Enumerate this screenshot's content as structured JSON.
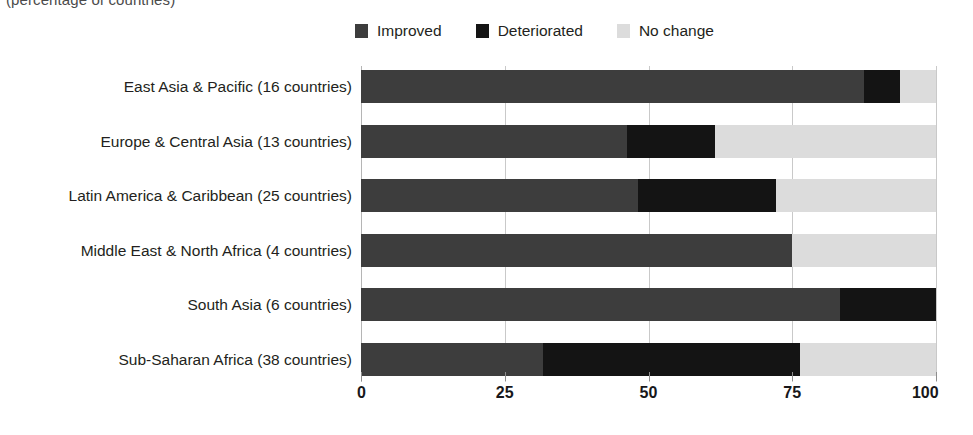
{
  "subtitle": "(percentage of countries)",
  "legend": {
    "position": "top-center",
    "items": [
      {
        "label": "Improved",
        "color": "#3d3d3d",
        "icon": "legend-swatch-improved"
      },
      {
        "label": "Deteriorated",
        "color": "#141414",
        "icon": "legend-swatch-deteriorated"
      },
      {
        "label": "No change",
        "color": "#dcdcdc",
        "icon": "legend-swatch-no-change"
      }
    ]
  },
  "axis": {
    "ticks": [
      "0",
      "25",
      "50",
      "75",
      "100"
    ],
    "tick_values": [
      0,
      25,
      50,
      75,
      100
    ],
    "min": 0,
    "max": 100
  },
  "chart_data": {
    "type": "bar",
    "orientation": "horizontal",
    "stacked": true,
    "title": "",
    "subtitle": "(percentage of countries)",
    "xlabel": "",
    "ylabel": "",
    "xlim": [
      0,
      100
    ],
    "grid": true,
    "legend_position": "top-center",
    "categories": [
      "East Asia & Pacific (16 countries)",
      "Europe & Central Asia (13 countries)",
      "Latin America & Caribbean (25 countries)",
      "Middle East & North Africa (4 countries)",
      "South Asia (6 countries)",
      "Sub-Saharan Africa (38 countries)"
    ],
    "series": [
      {
        "name": "Improved",
        "color": "#3d3d3d",
        "values": [
          87.5,
          46.2,
          48.2,
          75.0,
          83.3,
          31.6
        ]
      },
      {
        "name": "Deteriorated",
        "color": "#141414",
        "values": [
          6.2,
          15.4,
          24.0,
          0.0,
          16.7,
          44.7
        ]
      },
      {
        "name": "No change",
        "color": "#dcdcdc",
        "values": [
          6.3,
          38.4,
          27.8,
          25.0,
          0.0,
          23.7
        ]
      }
    ]
  }
}
